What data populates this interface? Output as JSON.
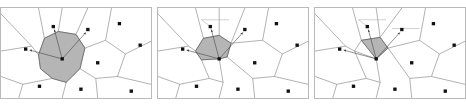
{
  "figure": {
    "type": "voronoi-sequence",
    "panel_count": 3,
    "background_color": "#ffffff",
    "frame_color": "#b9b9b9",
    "edge_color": "#6f6f6f",
    "site_color": "#111111",
    "shaded_fill": "#a8a8a8",
    "shaded_stroke": "#5a5a5a",
    "arrow_color": "#444444",
    "label_color": "#777777",
    "caption": ""
  },
  "panels": [
    {
      "id": "panel-1",
      "name": "voronoi-panel-left",
      "stage_label": "",
      "highlight_shape": "heptagon",
      "highlight_size": "large",
      "center_site": {
        "x": 62,
        "y": 52
      },
      "sites": [
        {
          "x": 62,
          "y": 52,
          "role": "center"
        },
        {
          "x": 53,
          "y": 19,
          "role": "neighbor"
        },
        {
          "x": 88,
          "y": 22,
          "role": "neighbor"
        },
        {
          "x": 25,
          "y": 42,
          "role": "neighbor"
        },
        {
          "x": 120,
          "y": 16,
          "role": "outer"
        },
        {
          "x": 141,
          "y": 38,
          "role": "outer"
        },
        {
          "x": 98,
          "y": 56,
          "role": "outer"
        },
        {
          "x": 39,
          "y": 80,
          "role": "outer"
        },
        {
          "x": 81,
          "y": 83,
          "role": "outer"
        },
        {
          "x": 132,
          "y": 85,
          "role": "outer"
        }
      ],
      "arrows": [
        {
          "to_x": 53,
          "to_y": 19
        },
        {
          "to_x": 88,
          "to_y": 22
        },
        {
          "to_x": 25,
          "to_y": 42
        }
      ],
      "highlight_polygon": "38,48 44,31 58,24 76,27 85,41 80,62 66,76 52,72 40,62",
      "labels": [
        {
          "text": "",
          "x": 66,
          "y": 52,
          "anchor": "start"
        }
      ]
    },
    {
      "id": "panel-2",
      "name": "voronoi-panel-middle",
      "stage_label": "",
      "highlight_shape": "pentagon",
      "highlight_size": "medium",
      "center_site": {
        "x": 62,
        "y": 52
      },
      "sites": [
        {
          "x": 62,
          "y": 52,
          "role": "center"
        },
        {
          "x": 53,
          "y": 19,
          "role": "neighbor"
        },
        {
          "x": 88,
          "y": 22,
          "role": "neighbor"
        },
        {
          "x": 25,
          "y": 42,
          "role": "neighbor"
        },
        {
          "x": 120,
          "y": 16,
          "role": "outer"
        },
        {
          "x": 141,
          "y": 38,
          "role": "outer"
        },
        {
          "x": 98,
          "y": 56,
          "role": "outer"
        },
        {
          "x": 39,
          "y": 80,
          "role": "outer"
        },
        {
          "x": 81,
          "y": 83,
          "role": "outer"
        },
        {
          "x": 132,
          "y": 85,
          "role": "outer"
        }
      ],
      "arrows": [
        {
          "to_x": 53,
          "to_y": 19
        },
        {
          "to_x": 88,
          "to_y": 22
        },
        {
          "to_x": 25,
          "to_y": 42
        }
      ],
      "highlight_polygon": "38,44 46,31 62,28 74,36 70,50 62,52 44,53",
      "labels": [
        {
          "text": "",
          "x": 44,
          "y": 13,
          "anchor": "start"
        },
        {
          "text": "",
          "x": 66,
          "y": 52,
          "anchor": "start"
        }
      ]
    },
    {
      "id": "panel-3",
      "name": "voronoi-panel-right",
      "stage_label": "",
      "highlight_shape": "triangle",
      "highlight_size": "small",
      "center_site": {
        "x": 62,
        "y": 52
      },
      "sites": [
        {
          "x": 62,
          "y": 52,
          "role": "center"
        },
        {
          "x": 53,
          "y": 19,
          "role": "neighbor"
        },
        {
          "x": 88,
          "y": 22,
          "role": "neighbor"
        },
        {
          "x": 25,
          "y": 42,
          "role": "neighbor"
        },
        {
          "x": 120,
          "y": 16,
          "role": "outer"
        },
        {
          "x": 141,
          "y": 38,
          "role": "outer"
        },
        {
          "x": 98,
          "y": 56,
          "role": "outer"
        },
        {
          "x": 39,
          "y": 80,
          "role": "outer"
        },
        {
          "x": 81,
          "y": 83,
          "role": "outer"
        },
        {
          "x": 132,
          "y": 85,
          "role": "outer"
        }
      ],
      "arrows": [
        {
          "to_x": 53,
          "to_y": 19
        },
        {
          "to_x": 88,
          "to_y": 22
        },
        {
          "to_x": 25,
          "to_y": 42
        }
      ],
      "highlight_polygon": "47,33 66,30 74,41 62,52",
      "labels": [
        {
          "text": "",
          "x": 44,
          "y": 13,
          "anchor": "start"
        },
        {
          "text": "",
          "x": 80,
          "y": 22,
          "anchor": "start"
        },
        {
          "text": "",
          "x": 66,
          "y": 52,
          "anchor": "start"
        }
      ]
    }
  ]
}
